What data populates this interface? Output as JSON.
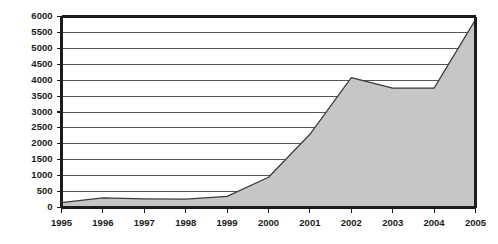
{
  "chart_data": {
    "type": "area",
    "title": "",
    "subtitle": "",
    "xlabel": "",
    "ylabel": "",
    "categories": [
      "1995",
      "1996",
      "1997",
      "1998",
      "1999",
      "2000",
      "2001",
      "2002",
      "2003",
      "2004",
      "2005"
    ],
    "x": [
      1995,
      1996,
      1997,
      1998,
      1999,
      2000,
      2001,
      2002,
      2003,
      2004,
      2005
    ],
    "values": [
      150,
      300,
      270,
      260,
      350,
      950,
      2300,
      4080,
      3750,
      3750,
      5900
    ],
    "series": [
      {
        "name": "series-1",
        "values": [
          150,
          300,
          270,
          260,
          350,
          950,
          2300,
          4080,
          3750,
          3750,
          5900
        ]
      }
    ],
    "ylim": [
      0,
      6000
    ],
    "xlim": [
      1995,
      2005
    ],
    "ytick_labels": [
      "0",
      "500",
      "1000",
      "1500",
      "2000",
      "2500",
      "3000",
      "3500",
      "4000",
      "4500",
      "5000",
      "5500",
      "6000"
    ],
    "ytick_values": [
      0,
      500,
      1000,
      1500,
      2000,
      2500,
      3000,
      3500,
      4000,
      4500,
      5000,
      5500,
      6000
    ],
    "xtick_labels": [
      "1995",
      "1996",
      "1997",
      "1998",
      "1999",
      "2000",
      "2001",
      "2002",
      "2003",
      "2004",
      "2005"
    ],
    "grid": true,
    "grid_axis": "y",
    "legend": false,
    "legend_position": "none",
    "colors": {
      "area_fill": "#c6c6c6",
      "area_stroke": "#3a3a3a",
      "grid": "#2b2b2b",
      "axis": "#1c1c1c",
      "text": "#1a1a1a",
      "background": "#ffffff"
    }
  }
}
